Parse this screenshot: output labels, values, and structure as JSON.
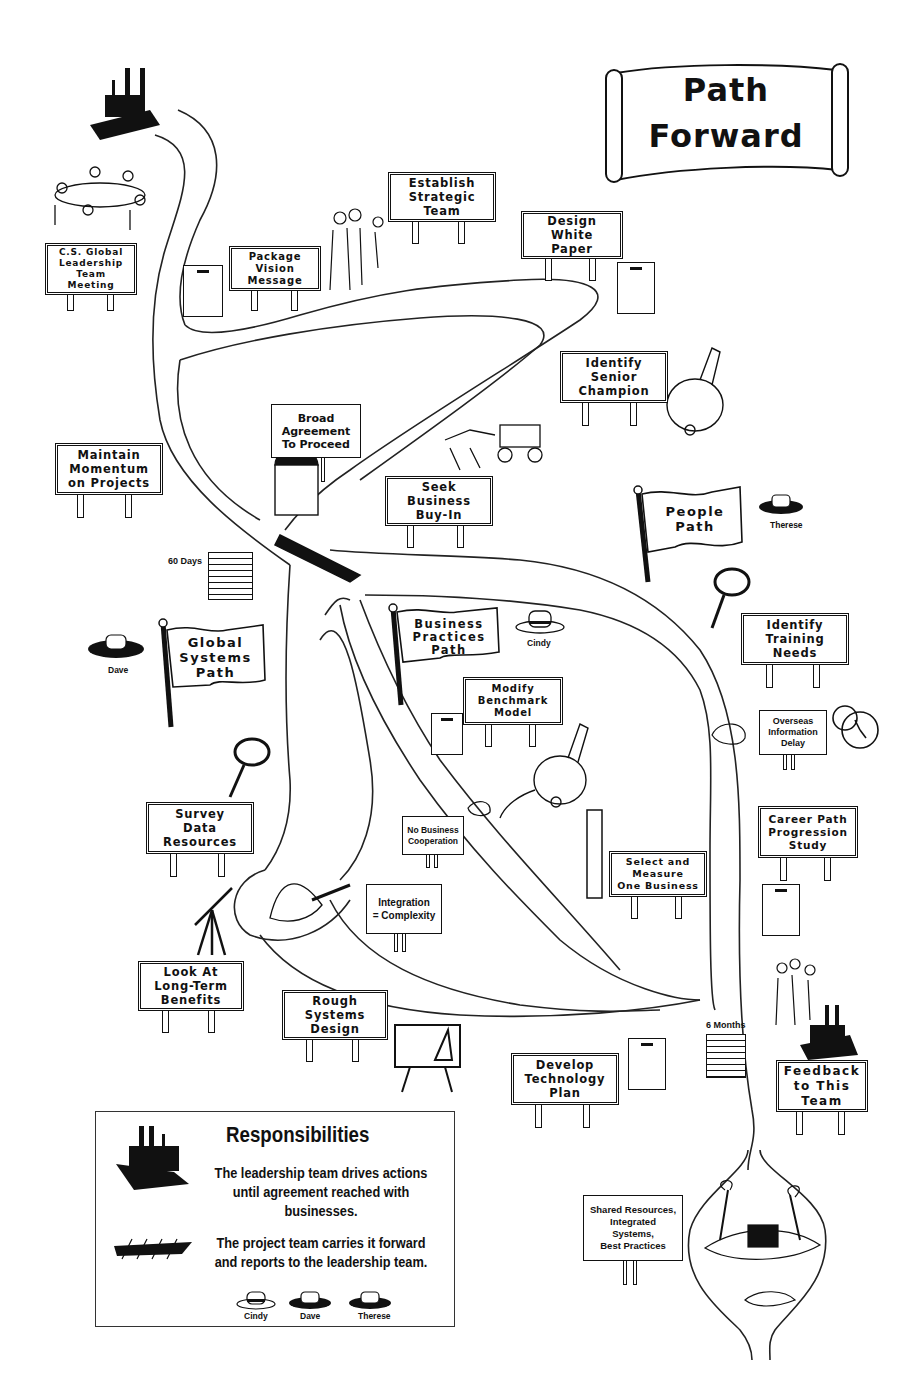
{
  "title": {
    "line1": "Path",
    "line2": "Forward"
  },
  "signs": [
    {
      "id": "cs-global-meeting",
      "text": "C.S. Global\nLeadership\nTeam Meeting"
    },
    {
      "id": "package-vision",
      "text": "Package\nVision\nMessage"
    },
    {
      "id": "establish-strategic-team",
      "text": "Establish\nStrategic\nTeam"
    },
    {
      "id": "design-white-paper",
      "text": "Design\nWhite\nPaper"
    },
    {
      "id": "identify-senior-champion",
      "text": "Identify\nSenior\nChampion"
    },
    {
      "id": "broad-agreement",
      "text": "Broad\nAgreement\nTo Proceed"
    },
    {
      "id": "maintain-momentum",
      "text": "Maintain\nMomentum\non Projects"
    },
    {
      "id": "seek-business-buy-in",
      "text": "Seek\nBusiness\nBuy-In"
    },
    {
      "id": "identify-training-needs",
      "text": "Identify\nTraining\nNeeds"
    },
    {
      "id": "overseas-information-delay",
      "text": "Overseas\nInformation\nDelay"
    },
    {
      "id": "modify-benchmark-model",
      "text": "Modify\nBenchmark\nModel"
    },
    {
      "id": "survey-data-resources",
      "text": "Survey\nData\nResources"
    },
    {
      "id": "no-business-cooperation",
      "text": "No Business\nCooperation"
    },
    {
      "id": "career-path-study",
      "text": "Career Path\nProgression\nStudy"
    },
    {
      "id": "select-measure-business",
      "text": "Select and\nMeasure\nOne Business"
    },
    {
      "id": "integration-complexity",
      "text": "Integration\n= Complexity"
    },
    {
      "id": "look-long-term-benefits",
      "text": "Look At\nLong-Term\nBenefits"
    },
    {
      "id": "rough-systems-design",
      "text": "Rough\nSystems\nDesign"
    },
    {
      "id": "develop-technology-plan",
      "text": "Develop\nTechnology\nPlan"
    },
    {
      "id": "feedback-to-team",
      "text": "Feedback\nto This\nTeam"
    },
    {
      "id": "shared-resources",
      "text": "Shared Resources,\nIntegrated Systems,\nBest Practices"
    }
  ],
  "flags": [
    {
      "id": "people-path",
      "text": "People\nPath",
      "owner": "Therese"
    },
    {
      "id": "global-systems-path",
      "text": "Global\nSystems\nPath",
      "owner": "Dave"
    },
    {
      "id": "business-practices-path",
      "text": "Business\nPractices\nPath",
      "owner": "Cindy"
    }
  ],
  "milestones": [
    {
      "id": "60-days",
      "label": "60 Days"
    },
    {
      "id": "6-months",
      "label": "6 Months"
    }
  ],
  "legend": {
    "title": "Responsibilities",
    "leadership": "The leadership team drives actions\nuntil agreement reached with businesses.",
    "project": "The project team carries it forward\nand reports to the leadership team.",
    "people": [
      "Cindy",
      "Dave",
      "Therese"
    ]
  }
}
